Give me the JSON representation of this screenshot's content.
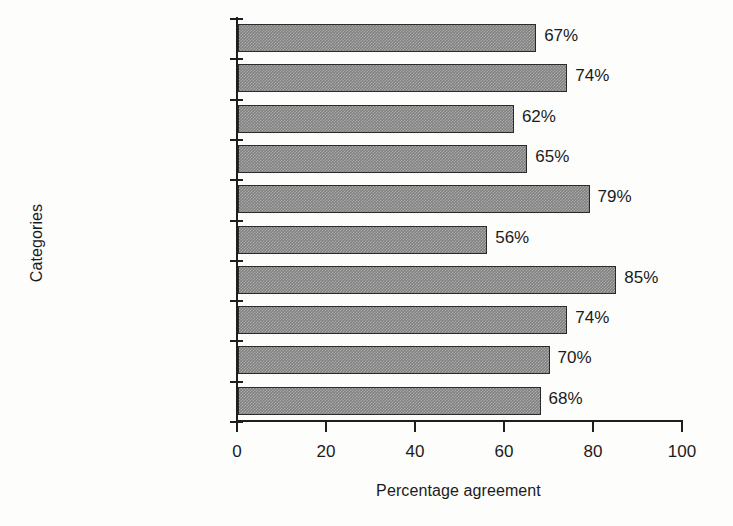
{
  "chart_data": {
    "type": "bar",
    "orientation": "horizontal",
    "title": "",
    "xlabel": "Percentage agreement",
    "ylabel": "Categories",
    "xlim": [
      0,
      100
    ],
    "xticks": [
      0,
      20,
      40,
      60,
      80,
      100
    ],
    "xtick_labels": [
      "0",
      "20",
      "40",
      "60",
      "80",
      "100"
    ],
    "grid": false,
    "legend": null,
    "bar_color": "#808080",
    "bar_edge_color": "#2a2a2a",
    "categories": [
      "Action Category",
      "Activity",
      "Coupling",
      "Wrist",
      "Lower Arm",
      "Upper Arm",
      "Load/Force",
      "Legs",
      "Neck",
      "Trunk"
    ],
    "values": [
      67,
      74,
      62,
      65,
      79,
      56,
      85,
      74,
      70,
      68
    ],
    "value_labels": [
      "67%",
      "74%",
      "62%",
      "65%",
      "79%",
      "56%",
      "85%",
      "74%",
      "70%",
      "68%"
    ]
  }
}
